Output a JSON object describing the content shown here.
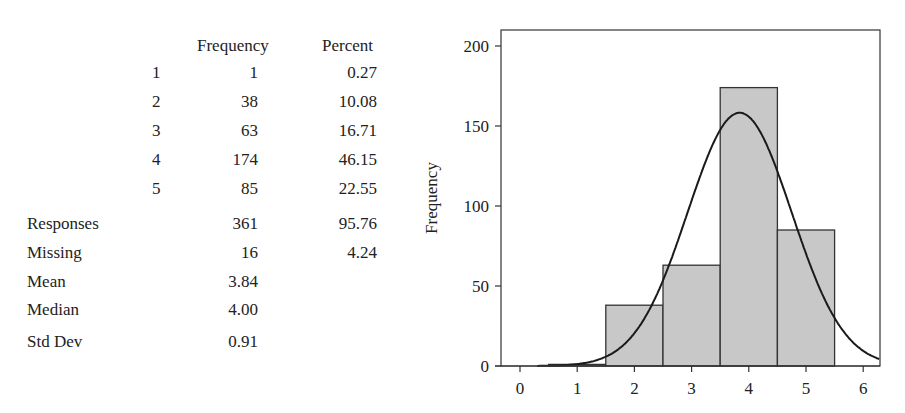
{
  "table": {
    "headers": {
      "frequency": "Frequency",
      "percent": "Percent"
    },
    "rows": [
      {
        "label": "1",
        "frequency": "1",
        "percent": "0.27"
      },
      {
        "label": "2",
        "frequency": "38",
        "percent": "10.08"
      },
      {
        "label": "3",
        "frequency": "63",
        "percent": "16.71"
      },
      {
        "label": "4",
        "frequency": "174",
        "percent": "46.15"
      },
      {
        "label": "5",
        "frequency": "85",
        "percent": "22.55"
      }
    ],
    "summary": [
      {
        "label": "Responses",
        "frequency": "361",
        "percent": "95.76"
      },
      {
        "label": "Missing",
        "frequency": "16",
        "percent": "4.24"
      },
      {
        "label": "Mean",
        "frequency": "3.84",
        "percent": ""
      },
      {
        "label": "Median",
        "frequency": "4.00",
        "percent": ""
      },
      {
        "label": "Std Dev",
        "frequency": "0.91",
        "percent": ""
      }
    ]
  },
  "colors": {
    "bar_fill": "#c8c8c8",
    "bar_stroke": "#333333",
    "curve": "#1a1a1a",
    "axis": "#333333",
    "text": "#222222"
  },
  "chart_data": {
    "type": "bar",
    "title": "",
    "xlabel": "",
    "ylabel": "Frequency",
    "categories": [
      "1",
      "2",
      "3",
      "4",
      "5"
    ],
    "values": [
      1,
      38,
      63,
      174,
      85
    ],
    "bin_width": 1,
    "xlim": [
      -0.35,
      6.3
    ],
    "ylim": [
      0,
      210
    ],
    "x_ticks": [
      0,
      1,
      2,
      3,
      4,
      5,
      6
    ],
    "y_ticks": [
      0,
      50,
      100,
      150,
      200
    ],
    "grid": false,
    "overlay": {
      "type": "normal_curve",
      "mean": 3.84,
      "std": 0.91,
      "n": 361
    }
  }
}
